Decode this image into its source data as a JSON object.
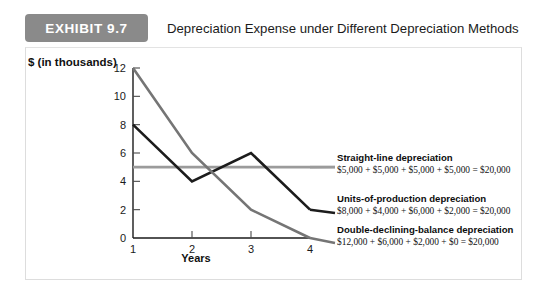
{
  "header": {
    "badge_label": "EXHIBIT 9.7",
    "title": "Depreciation Expense under Different Depreciation Methods",
    "badge_color": "#8a8a8a"
  },
  "chart_data": {
    "type": "line",
    "title": "Depreciation Expense under Different Depreciation Methods",
    "xlabel": "Years",
    "ylabel": "$ (in thousands)",
    "x": [
      1,
      2,
      3,
      4
    ],
    "xtick_labels": [
      "1",
      "2",
      "3",
      "4"
    ],
    "ytick_labels": [
      "0",
      "2",
      "4",
      "6",
      "8",
      "10",
      "12"
    ],
    "yticks": [
      0,
      2,
      4,
      6,
      8,
      10,
      12
    ],
    "ylim": [
      0,
      12
    ],
    "xlim": [
      1,
      4
    ],
    "grid": false,
    "legend_position": "right",
    "series": [
      {
        "name": "Straight-line depreciation",
        "values": [
          5,
          5,
          5,
          5
        ],
        "color": "#9b9b9b",
        "formula": "$5,000 + $5,000 + $5,000 + $5,000 = $20,000"
      },
      {
        "name": "Units-of-production depreciation",
        "values": [
          8,
          4,
          6,
          2
        ],
        "color": "#1c1c1c",
        "formula": "$8,000 + $4,000 + $6,000 + $2,000 = $20,000"
      },
      {
        "name": "Double-declining-balance depreciation",
        "values": [
          12,
          6,
          2,
          0
        ],
        "color": "#757575",
        "formula": "$12,000 + $6,000 + $2,000 + $0 = $20,000"
      }
    ]
  }
}
